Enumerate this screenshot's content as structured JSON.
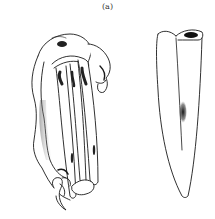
{
  "figure": {
    "panel_label": "(a)",
    "drawings": [
      {
        "name": "claw-structure-side-view",
        "position": "left"
      },
      {
        "name": "tubular-spine-view",
        "position": "right"
      }
    ],
    "colors": {
      "ink": "#1a1a1a",
      "stipple": "#555555",
      "background": "#ffffff"
    }
  }
}
